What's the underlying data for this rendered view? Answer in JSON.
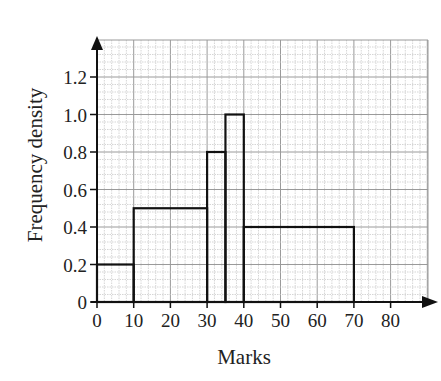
{
  "chart_data": {
    "type": "histogram",
    "title": "",
    "xlabel": "Marks",
    "ylabel": "Frequency density",
    "xlim": [
      0,
      90
    ],
    "ylim": [
      0,
      1.3
    ],
    "grid": true,
    "legend": null,
    "x_ticks": [
      "0",
      "10",
      "20",
      "30",
      "40",
      "50",
      "60",
      "70",
      "80"
    ],
    "y_ticks": [
      "0",
      "0.2",
      "0.4",
      "0.6",
      "0.8",
      "1.0",
      "1.2"
    ],
    "bins": [
      {
        "from": 0,
        "to": 10,
        "frequency_density": 0.2
      },
      {
        "from": 10,
        "to": 30,
        "frequency_density": 0.5
      },
      {
        "from": 30,
        "to": 35,
        "frequency_density": 0.8
      },
      {
        "from": 35,
        "to": 40,
        "frequency_density": 1.0
      },
      {
        "from": 40,
        "to": 70,
        "frequency_density": 0.4
      }
    ]
  },
  "colors": {
    "axis": "#111111",
    "bar_outline": "#111111",
    "grid_major": "#9a9a9a",
    "grid_minor": "#c4c4c4"
  }
}
